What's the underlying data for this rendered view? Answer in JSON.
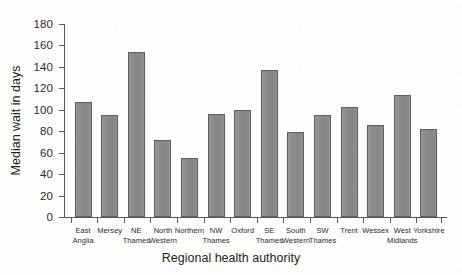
{
  "chart_data": {
    "type": "bar",
    "title": "",
    "xlabel": "Regional health authority",
    "ylabel": "Median wait in days",
    "categories": [
      "East Anglia",
      "Mersey",
      "NE Thames",
      "North Western",
      "Northern",
      "NW Thames",
      "Oxford",
      "SE Thames",
      "South Western",
      "SW Thames",
      "Trent",
      "Wessex",
      "West Midlands",
      "Yorkshire"
    ],
    "category_lines": [
      [
        "East",
        "Anglia"
      ],
      [
        "Mersey",
        ""
      ],
      [
        "NE",
        "Thames"
      ],
      [
        "North",
        "Western"
      ],
      [
        "Northern",
        ""
      ],
      [
        "NW",
        "Thames"
      ],
      [
        "Oxford",
        ""
      ],
      [
        "SE",
        "Thames"
      ],
      [
        "South",
        "Western"
      ],
      [
        "SW",
        "Thames"
      ],
      [
        "Trent",
        ""
      ],
      [
        "Wessex",
        ""
      ],
      [
        "West",
        "Midlands"
      ],
      [
        "Yorkshire",
        ""
      ]
    ],
    "values": [
      107,
      95,
      154,
      72,
      55,
      96,
      100,
      137,
      79,
      95,
      103,
      86,
      114,
      82
    ],
    "ylim": [
      0,
      180
    ],
    "yticks": [
      0,
      20,
      40,
      60,
      80,
      100,
      120,
      140,
      160,
      180
    ],
    "ytick_labels": [
      "0",
      "20",
      "40",
      "60",
      "80",
      "100",
      "120",
      "140",
      "160",
      "180"
    ],
    "grid": false,
    "legend": null,
    "bar_color": "#8b8b8b",
    "bar_edge_color": "#5e5e5e",
    "axis_color": "#58585a",
    "background_color": "#fdfdfc"
  }
}
